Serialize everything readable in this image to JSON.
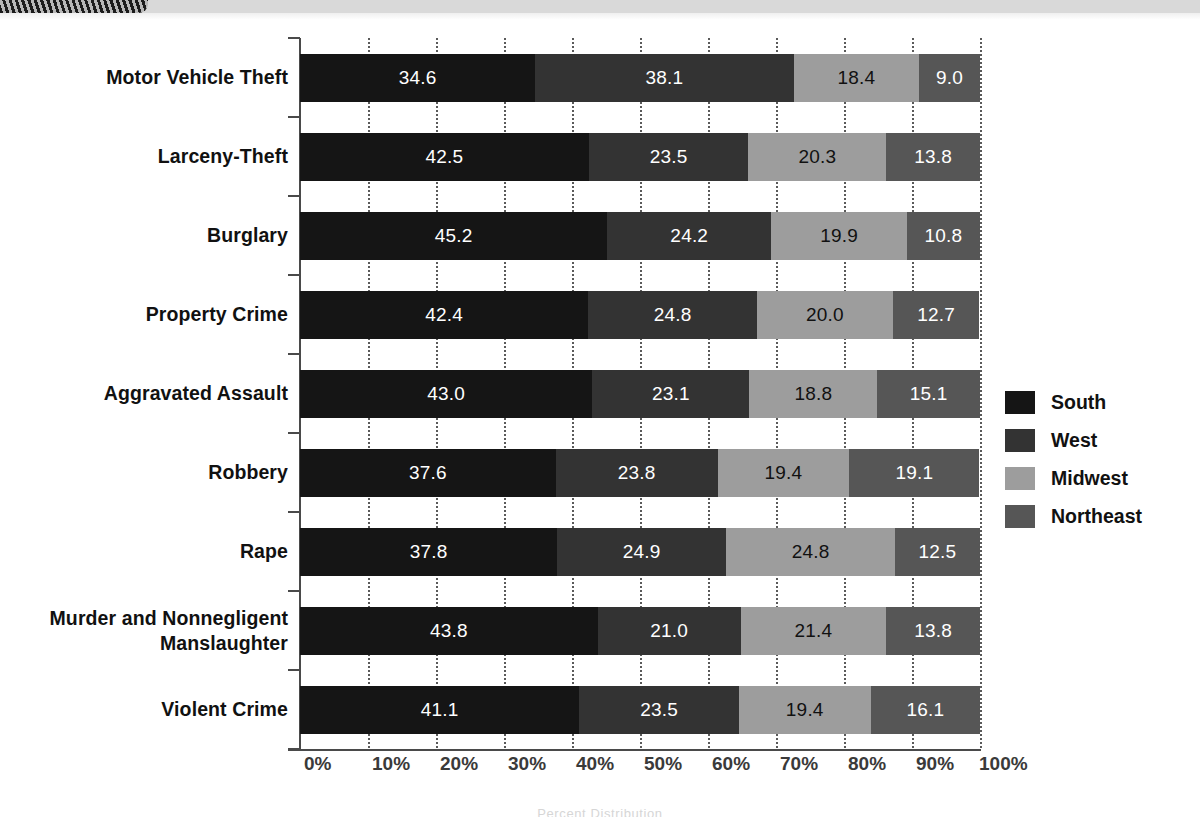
{
  "banner": {
    "tab_label": ""
  },
  "footer": {
    "ghost_text": "Percent Distribution"
  },
  "legend": {
    "position": "right",
    "items": [
      {
        "label": "South",
        "color": "#151515",
        "swatch": "south-swatch"
      },
      {
        "label": "West",
        "color": "#333333",
        "swatch": "west-swatch"
      },
      {
        "label": "Midwest",
        "color": "#9d9d9d",
        "swatch": "midwest-swatch"
      },
      {
        "label": "Northeast",
        "color": "#565656",
        "swatch": "northeast-swatch"
      }
    ]
  },
  "axis": {
    "x_ticks": [
      "0%",
      "10%",
      "20%",
      "30%",
      "40%",
      "50%",
      "60%",
      "70%",
      "80%",
      "90%",
      "100%"
    ]
  },
  "chart_data": {
    "type": "bar",
    "orientation": "horizontal",
    "stacked": true,
    "stacked_normalized": true,
    "title": "",
    "subtitle": "",
    "xlabel": "",
    "ylabel": "",
    "xlim": [
      0,
      100
    ],
    "xtick_labels": [
      "0%",
      "10%",
      "20%",
      "30%",
      "40%",
      "50%",
      "60%",
      "70%",
      "80%",
      "90%",
      "100%"
    ],
    "xticks": [
      0,
      10,
      20,
      30,
      40,
      50,
      60,
      70,
      80,
      90,
      100
    ],
    "grid": "vertical-dotted",
    "legend_position": "right",
    "categories": [
      "Motor Vehicle Theft",
      "Larceny-Theft",
      "Burglary",
      "Property Crime",
      "Aggravated Assault",
      "Robbery",
      "Rape",
      "Murder and Nonnegligent Manslaughter",
      "Violent Crime"
    ],
    "category_lines": [
      [
        "Motor Vehicle Theft"
      ],
      [
        "Larceny-Theft"
      ],
      [
        "Burglary"
      ],
      [
        "Property Crime"
      ],
      [
        "Aggravated Assault"
      ],
      [
        "Robbery"
      ],
      [
        "Rape"
      ],
      [
        "Murder and Nonnegligent",
        "Manslaughter"
      ],
      [
        "Violent Crime"
      ]
    ],
    "series": [
      {
        "name": "South",
        "color": "#151515",
        "label_color": "#ffffff",
        "values": [
          34.6,
          42.5,
          45.2,
          42.4,
          43.0,
          37.6,
          37.8,
          43.8,
          41.1
        ]
      },
      {
        "name": "West",
        "color": "#333333",
        "label_color": "#ffffff",
        "values": [
          38.1,
          23.5,
          24.2,
          24.8,
          23.1,
          23.8,
          24.9,
          21.0,
          23.5
        ]
      },
      {
        "name": "Midwest",
        "color": "#9d9d9d",
        "label_color": "#111111",
        "values": [
          18.4,
          20.3,
          19.9,
          20.0,
          18.8,
          19.4,
          24.8,
          21.4,
          19.4
        ]
      },
      {
        "name": "Northeast",
        "color": "#565656",
        "label_color": "#ffffff",
        "values": [
          9.0,
          13.8,
          10.8,
          12.7,
          15.1,
          19.1,
          12.5,
          13.8,
          16.1
        ]
      }
    ],
    "rows": [
      {
        "category": "Motor Vehicle Theft",
        "South": "34.6",
        "West": "38.1",
        "Midwest": "18.4",
        "Northeast": "9.0"
      },
      {
        "category": "Larceny-Theft",
        "South": "42.5",
        "West": "23.5",
        "Midwest": "20.3",
        "Northeast": "13.8"
      },
      {
        "category": "Burglary",
        "South": "45.2",
        "West": "24.2",
        "Midwest": "19.9",
        "Northeast": "10.8"
      },
      {
        "category": "Property Crime",
        "South": "42.4",
        "West": "24.8",
        "Midwest": "20.0",
        "Northeast": "12.7"
      },
      {
        "category": "Aggravated Assault",
        "South": "43.0",
        "West": "23.1",
        "Midwest": "18.8",
        "Northeast": "15.1"
      },
      {
        "category": "Robbery",
        "South": "37.6",
        "West": "23.8",
        "Midwest": "19.4",
        "Northeast": "19.1"
      },
      {
        "category": "Rape",
        "South": "37.8",
        "West": "24.9",
        "Midwest": "24.8",
        "Northeast": "12.5"
      },
      {
        "category": "Murder and Nonnegligent Manslaughter",
        "South": "43.8",
        "West": "21.0",
        "Midwest": "21.4",
        "Northeast": "13.8"
      },
      {
        "category": "Violent Crime",
        "South": "41.1",
        "West": "23.5",
        "Midwest": "19.4",
        "Northeast": "16.1"
      }
    ]
  }
}
